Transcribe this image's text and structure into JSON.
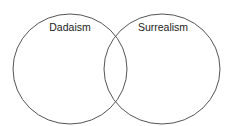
{
  "diagram": {
    "type": "venn",
    "sets": [
      {
        "label": "Dadaism",
        "cx": 70,
        "cy": 69,
        "rx": 57,
        "ry": 55
      },
      {
        "label": "Surrealism",
        "cx": 162,
        "cy": 69,
        "rx": 58,
        "ry": 55
      }
    ],
    "stroke_color": "#555555",
    "background": "#ffffff"
  }
}
